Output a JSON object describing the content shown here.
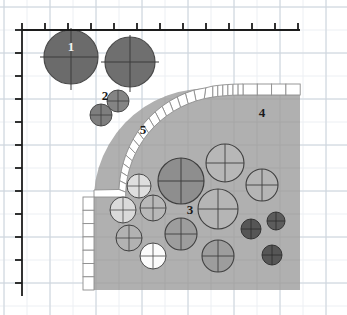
{
  "figure": {
    "background_color": "#ffffff",
    "grid": {
      "minor_color": "#e9edf2",
      "major_color": "#c9d2da",
      "minor_step_px": 23,
      "origin_x_px": 22,
      "origin_y_px": 30,
      "visible": true
    },
    "axes": {
      "line_color": "#1c1c1c",
      "top_axis": {
        "name": "top-scale-axis",
        "y_px": 30,
        "x_start_px": 22,
        "x_end_px": 300,
        "tick_count": 13,
        "tick_step_px": 23,
        "tick_length_px": 7,
        "tick_direction": "up"
      },
      "left_axis": {
        "name": "left-scale-axis",
        "x_px": 22,
        "y_start_px": 30,
        "y_end_px": 296,
        "tick_count": 12,
        "tick_step_px": 23,
        "tick_length_px": 7,
        "tick_direction": "left"
      }
    },
    "region": {
      "name": "shaded-body-region",
      "fill_color": "#b0b0b0",
      "edge_color": "#9a9a9a",
      "right_edge_px": 300,
      "bottom_edge_px": 290,
      "corner_radius_px": 112,
      "description": "Large grey body with a rounded upper-left corner"
    },
    "band": {
      "name": "segmented-boundary-band",
      "fill_color": "#ffffff",
      "stroke_color": "#8d8d8d",
      "thickness_px": 11,
      "segment_count": 34,
      "description": "White segmented liner following the rounded boundary of the grey body"
    },
    "callouts": [
      {
        "id": "callout-1",
        "label": "1",
        "x": 71,
        "y": 51,
        "style": "light",
        "target": "large dark sphere, upper left"
      },
      {
        "id": "callout-2",
        "label": "2",
        "x": 105,
        "y": 100,
        "style": "dark",
        "target": "small sphere pair, upper left"
      },
      {
        "id": "callout-3",
        "label": "3",
        "x": 190,
        "y": 214,
        "style": "dark",
        "target": "mid-field spheres inside body"
      },
      {
        "id": "callout-4",
        "label": "4",
        "x": 262,
        "y": 117,
        "style": "dark",
        "target": "grey body interior"
      },
      {
        "id": "callout-5",
        "label": "5",
        "x": 143,
        "y": 134,
        "style": "dark",
        "target": "segmented boundary band"
      }
    ],
    "spheres": {
      "outside_body": [
        {
          "name": "sphere-outside-large-1",
          "cx": 71,
          "cy": 57,
          "r": 27,
          "fill": "#6b6b6b",
          "stroke": "#4a4a4a",
          "crosshair": "#3d3d3d"
        },
        {
          "name": "sphere-outside-large-2",
          "cx": 130,
          "cy": 62,
          "r": 25,
          "fill": "#6f6f6f",
          "stroke": "#4a4a4a",
          "crosshair": "#3d3d3d"
        },
        {
          "name": "sphere-outside-small-1",
          "cx": 118,
          "cy": 101,
          "r": 11,
          "fill": "#848484",
          "stroke": "#4a4a4a",
          "crosshair": "#3d3d3d"
        },
        {
          "name": "sphere-outside-small-2",
          "cx": 101,
          "cy": 115,
          "r": 11,
          "fill": "#7e7e7e",
          "stroke": "#4a4a4a",
          "crosshair": "#3d3d3d"
        }
      ],
      "inside_body": [
        {
          "name": "sphere-inside-dark-large",
          "cx": 181,
          "cy": 181,
          "r": 23,
          "fill": "#8e8e8e",
          "stroke": "#3f3f3f",
          "crosshair": "#3f3f3f"
        },
        {
          "name": "sphere-inside-outline-top",
          "cx": 225,
          "cy": 163,
          "r": 19,
          "fill": "#b7b7b7",
          "stroke": "#3f3f3f",
          "crosshair": "#3f3f3f"
        },
        {
          "name": "sphere-inside-outline-right",
          "cx": 262,
          "cy": 185,
          "r": 16,
          "fill": "#b5b5b5",
          "stroke": "#3f3f3f",
          "crosshair": "#3f3f3f"
        },
        {
          "name": "sphere-inside-outline-mid",
          "cx": 218,
          "cy": 209,
          "r": 20,
          "fill": "#b5b5b5",
          "stroke": "#3f3f3f",
          "crosshair": "#3f3f3f"
        },
        {
          "name": "sphere-inside-grey-mid",
          "cx": 181,
          "cy": 234,
          "r": 16,
          "fill": "#9d9d9d",
          "stroke": "#3f3f3f",
          "crosshair": "#3f3f3f"
        },
        {
          "name": "sphere-inside-grey-low",
          "cx": 218,
          "cy": 256,
          "r": 16,
          "fill": "#9d9d9d",
          "stroke": "#3f3f3f",
          "crosshair": "#3f3f3f"
        },
        {
          "name": "sphere-inside-light-upper",
          "cx": 139,
          "cy": 186,
          "r": 12,
          "fill": "#dedede",
          "stroke": "#4a4a4a",
          "crosshair": "#4a4a4a"
        },
        {
          "name": "sphere-inside-light-left",
          "cx": 123,
          "cy": 210,
          "r": 13,
          "fill": "#dadada",
          "stroke": "#4a4a4a",
          "crosshair": "#4a4a4a"
        },
        {
          "name": "sphere-inside-outline-small",
          "cx": 153,
          "cy": 208,
          "r": 13,
          "fill": "#b8b8b8",
          "stroke": "#3f3f3f",
          "crosshair": "#3f3f3f"
        },
        {
          "name": "sphere-inside-outline-lower",
          "cx": 129,
          "cy": 238,
          "r": 13,
          "fill": "#b2b2b2",
          "stroke": "#3f3f3f",
          "crosshair": "#3f3f3f"
        },
        {
          "name": "sphere-inside-white-low",
          "cx": 153,
          "cy": 256,
          "r": 13,
          "fill": "#fbfbfb",
          "stroke": "#4a4a4a",
          "crosshair": "#4a4a4a"
        },
        {
          "name": "sphere-inside-dark-small-1",
          "cx": 251,
          "cy": 229,
          "r": 10,
          "fill": "#565656",
          "stroke": "#343434",
          "crosshair": "#2b2b2b"
        },
        {
          "name": "sphere-inside-dark-small-2",
          "cx": 276,
          "cy": 221,
          "r": 9,
          "fill": "#5c5c5c",
          "stroke": "#343434",
          "crosshair": "#2b2b2b"
        },
        {
          "name": "sphere-inside-dark-small-3",
          "cx": 272,
          "cy": 255,
          "r": 10,
          "fill": "#565656",
          "stroke": "#343434",
          "crosshair": "#2b2b2b"
        }
      ]
    }
  }
}
